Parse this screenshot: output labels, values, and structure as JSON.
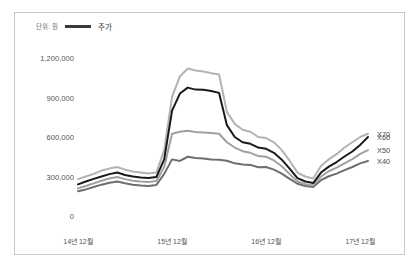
{
  "figure": {
    "legend": {
      "unit_text": "단위: 원",
      "series_marker_label": "주가",
      "marker_color": "#3a3a3a"
    }
  },
  "chart_data": {
    "type": "line",
    "title": "",
    "subtitle": "",
    "xlabel": "",
    "ylabel": "",
    "unit": "단위: 원",
    "legend_label": "주가",
    "legend_position": "top-left",
    "grid": false,
    "ylim": [
      0,
      1200000
    ],
    "ytick_labels": [
      "1,200,000",
      "900,000",
      "600,000",
      "300,000",
      "0"
    ],
    "ytick_values": [
      1200000,
      900000,
      600000,
      300000,
      0
    ],
    "xtick_labels": [
      "14년 12월",
      "15년 12월",
      "16년 12월",
      "17년 12월"
    ],
    "xtick_values": [
      0,
      12,
      24,
      36
    ],
    "xlim": [
      0,
      37
    ],
    "x": [
      0,
      1,
      2,
      3,
      4,
      5,
      6,
      7,
      8,
      9,
      10,
      11,
      12,
      13,
      14,
      15,
      16,
      17,
      18,
      19,
      20,
      21,
      22,
      23,
      24,
      25,
      26,
      27,
      28,
      29,
      30,
      31,
      32,
      33,
      34,
      35,
      36,
      37
    ],
    "series": [
      {
        "name": "X70",
        "color": "#b3b3b3",
        "end_label": "X70",
        "values": [
          280000,
          300000,
          320000,
          345000,
          360000,
          372000,
          352000,
          338000,
          330000,
          322000,
          330000,
          500000,
          905000,
          1060000,
          1120000,
          1105000,
          1098000,
          1085000,
          1075000,
          790000,
          700000,
          655000,
          640000,
          600000,
          592000,
          560000,
          500000,
          420000,
          330000,
          300000,
          285000,
          380000,
          430000,
          470000,
          520000,
          560000,
          600000,
          625000
        ]
      },
      {
        "name": "X60",
        "color": "#1a1a1a",
        "end_label": "X60",
        "values": [
          240000,
          262000,
          282000,
          300000,
          318000,
          330000,
          312000,
          300000,
          292000,
          288000,
          296000,
          430000,
          800000,
          930000,
          975000,
          960000,
          958000,
          950000,
          935000,
          690000,
          600000,
          560000,
          548000,
          520000,
          510000,
          480000,
          428000,
          360000,
          288000,
          262000,
          250000,
          330000,
          375000,
          410000,
          452000,
          490000,
          540000,
          600000
        ]
      },
      {
        "name": "X50",
        "color": "#a0a0a0",
        "end_label": "X50",
        "values": [
          210000,
          228000,
          248000,
          268000,
          285000,
          296000,
          280000,
          268000,
          262000,
          258000,
          266000,
          372000,
          625000,
          640000,
          648000,
          638000,
          635000,
          630000,
          625000,
          560000,
          520000,
          492000,
          480000,
          455000,
          450000,
          422000,
          378000,
          318000,
          262000,
          242000,
          232000,
          300000,
          340000,
          368000,
          400000,
          432000,
          472000,
          500000
        ]
      },
      {
        "name": "X40",
        "color": "#6e6e6e",
        "end_label": "X40",
        "values": [
          188000,
          202000,
          220000,
          238000,
          252000,
          262000,
          248000,
          238000,
          232000,
          228000,
          236000,
          320000,
          430000,
          418000,
          450000,
          440000,
          436000,
          430000,
          428000,
          420000,
          400000,
          392000,
          388000,
          370000,
          372000,
          352000,
          322000,
          282000,
          245000,
          228000,
          220000,
          272000,
          302000,
          322000,
          348000,
          372000,
          400000,
          418000
        ]
      }
    ]
  }
}
